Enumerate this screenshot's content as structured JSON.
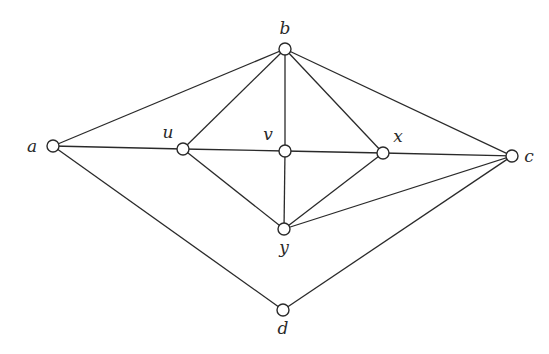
{
  "diagram": {
    "type": "graph",
    "directed": false,
    "node_radius": 6,
    "colors": {
      "stroke": "#2a2a2a",
      "node_fill": "#ffffff",
      "background": "#ffffff"
    },
    "nodes": [
      {
        "id": "a",
        "label": "a",
        "x": 53,
        "y": 146,
        "lx": 32,
        "ly": 152,
        "anchor": "middle"
      },
      {
        "id": "b",
        "label": "b",
        "x": 285,
        "y": 49,
        "lx": 285,
        "ly": 34,
        "anchor": "middle"
      },
      {
        "id": "c",
        "label": "c",
        "x": 512,
        "y": 156,
        "lx": 529,
        "ly": 162,
        "anchor": "middle"
      },
      {
        "id": "u",
        "label": "u",
        "x": 183,
        "y": 149,
        "lx": 168,
        "ly": 138,
        "anchor": "middle"
      },
      {
        "id": "v",
        "label": "v",
        "x": 285,
        "y": 151,
        "lx": 268,
        "ly": 140,
        "anchor": "middle"
      },
      {
        "id": "x",
        "label": "x",
        "x": 383,
        "y": 153,
        "lx": 398,
        "ly": 142,
        "anchor": "middle"
      },
      {
        "id": "y",
        "label": "y",
        "x": 284,
        "y": 229,
        "lx": 284,
        "ly": 253,
        "anchor": "middle"
      },
      {
        "id": "d",
        "label": "d",
        "x": 283,
        "y": 310,
        "lx": 283,
        "ly": 334,
        "anchor": "middle"
      }
    ],
    "edges": [
      [
        "a",
        "b"
      ],
      [
        "a",
        "u"
      ],
      [
        "a",
        "d"
      ],
      [
        "u",
        "b"
      ],
      [
        "u",
        "v"
      ],
      [
        "u",
        "y"
      ],
      [
        "b",
        "v"
      ],
      [
        "b",
        "x"
      ],
      [
        "b",
        "c"
      ],
      [
        "v",
        "x"
      ],
      [
        "v",
        "y"
      ],
      [
        "x",
        "c"
      ],
      [
        "x",
        "y"
      ],
      [
        "y",
        "c"
      ],
      [
        "d",
        "c"
      ]
    ]
  }
}
